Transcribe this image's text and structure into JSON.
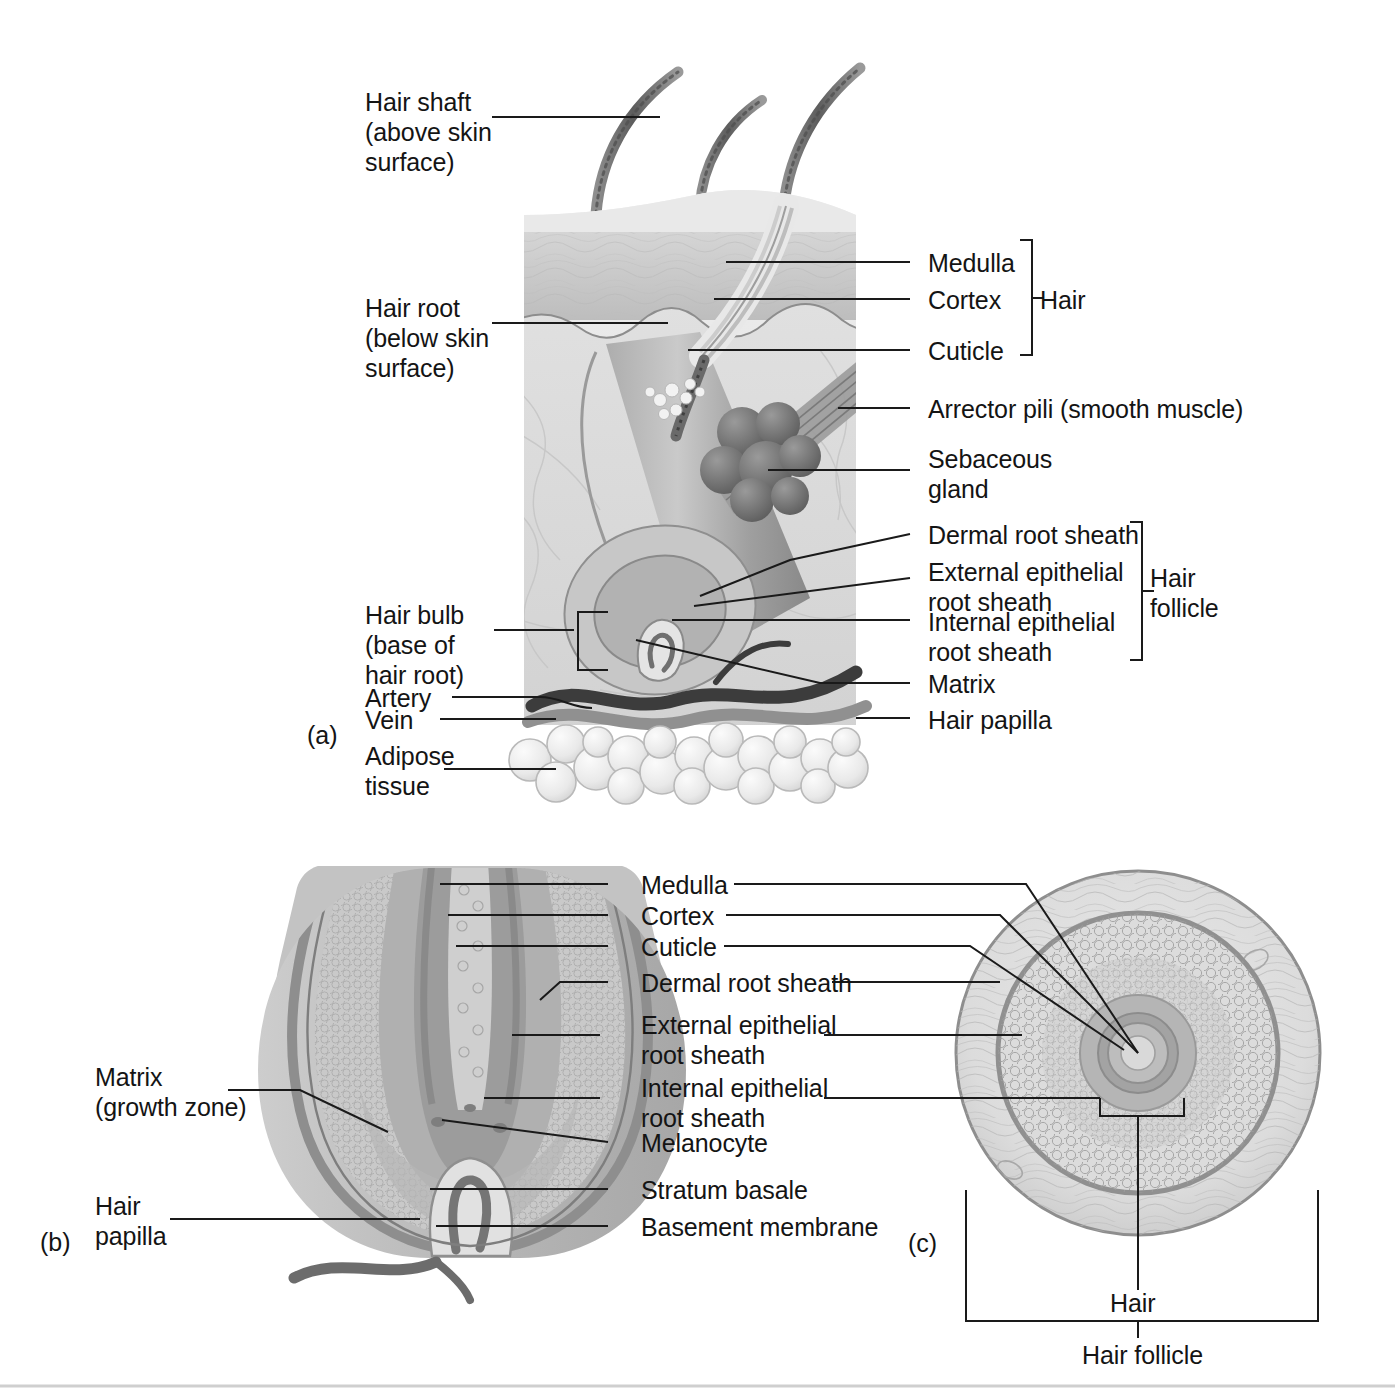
{
  "figure": {
    "panels": [
      {
        "id": "a",
        "letter": "(a)"
      },
      {
        "id": "b",
        "letter": "(b)"
      },
      {
        "id": "c",
        "letter": "(c)"
      }
    ]
  },
  "panel_a": {
    "letter": "(a)",
    "labels_left": [
      {
        "key": "hair_shaft",
        "line1": "Hair shaft",
        "line2": "(above skin",
        "line3": "surface)"
      },
      {
        "key": "hair_root",
        "line1": "Hair root",
        "line2": "(below skin",
        "line3": "surface)"
      },
      {
        "key": "hair_bulb",
        "line1": "Hair bulb",
        "line2": "(base of",
        "line3": "hair root)"
      },
      {
        "key": "artery",
        "line1": "Artery"
      },
      {
        "key": "vein",
        "line1": "Vein"
      },
      {
        "key": "adipose",
        "line1": "Adipose",
        "line2": "tissue"
      }
    ],
    "labels_right": [
      {
        "key": "medulla",
        "line1": "Medulla"
      },
      {
        "key": "cortex",
        "line1": "Cortex"
      },
      {
        "key": "cuticle",
        "line1": "Cuticle"
      },
      {
        "key": "arrector_pili",
        "line1": "Arrector pili (smooth muscle)"
      },
      {
        "key": "sebaceous_gland",
        "line1": "Sebaceous",
        "line2": "gland"
      },
      {
        "key": "dermal_root_sheath",
        "line1": "Dermal root sheath"
      },
      {
        "key": "external_epithelial_root_sheath",
        "line1": "External epithelial",
        "line2": "root sheath"
      },
      {
        "key": "internal_epithelial_root_sheath",
        "line1": "Internal epithelial",
        "line2": "root sheath"
      },
      {
        "key": "matrix",
        "line1": "Matrix"
      },
      {
        "key": "hair_papilla",
        "line1": "Hair papilla"
      }
    ],
    "brackets": [
      {
        "key": "hair",
        "line1": "Hair"
      },
      {
        "key": "hair_follicle",
        "line1": "Hair",
        "line2": "follicle"
      }
    ]
  },
  "panel_b": {
    "letter": "(b)",
    "labels_left": [
      {
        "key": "matrix",
        "line1": "Matrix",
        "line2": "(growth zone)"
      },
      {
        "key": "hair_papilla",
        "line1": "Hair",
        "line2": "papilla"
      }
    ],
    "labels_center": [
      {
        "key": "medulla",
        "line1": "Medulla"
      },
      {
        "key": "cortex",
        "line1": "Cortex"
      },
      {
        "key": "cuticle",
        "line1": "Cuticle"
      },
      {
        "key": "dermal_root_sheath",
        "line1": "Dermal root sheath"
      },
      {
        "key": "external_epithelial_root_sheath",
        "line1": "External epithelial",
        "line2": "root sheath"
      },
      {
        "key": "internal_epithelial_root_sheath",
        "line1": "Internal epithelial",
        "line2": "root sheath"
      },
      {
        "key": "melanocyte",
        "line1": "Melanocyte"
      },
      {
        "key": "stratum_basale",
        "line1": "Stratum basale"
      },
      {
        "key": "basement_membrane",
        "line1": "Basement membrane"
      }
    ]
  },
  "panel_c": {
    "letter": "(c)",
    "labels_bottom": [
      {
        "key": "hair",
        "line1": "Hair"
      },
      {
        "key": "hair_follicle",
        "line1": "Hair follicle"
      }
    ]
  },
  "colors": {
    "ink": "#141414",
    "leader": "#1a1a1a",
    "skin_light": "#e3e3e3",
    "skin_mid": "#cfcfcf",
    "skin_dark": "#a8a8a8",
    "hair_dark": "#6f6f6f",
    "vessel_dark": "#4a4a4a",
    "vessel_mid": "#8c8c8c",
    "background": "#ffffff"
  }
}
